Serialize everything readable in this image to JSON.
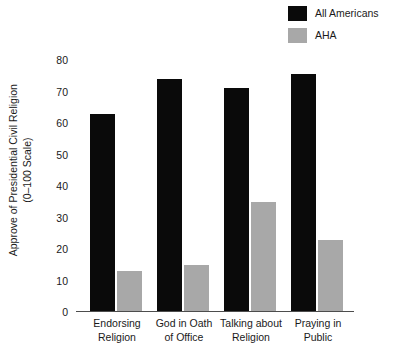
{
  "chart_data": {
    "type": "bar",
    "title": "",
    "xlabel": "",
    "ylabel": "Approve of Presidential Civil Religion",
    "ylabel_line2": "(0–100 Scale)",
    "ylim": [
      0,
      80
    ],
    "yticks": [
      0,
      10,
      20,
      30,
      40,
      50,
      60,
      70,
      80
    ],
    "grid": false,
    "legend_position": "top-right",
    "categories": [
      "Endorsing Religion",
      "God in Oath of Office",
      "Talking about Religion",
      "Praying in Public"
    ],
    "category_lines": [
      [
        "Endorsing",
        "Religion"
      ],
      [
        "God in Oath",
        "of Office"
      ],
      [
        "Talking about",
        "Religion"
      ],
      [
        "Praying in",
        "Public"
      ]
    ],
    "series": [
      {
        "name": "All Americans",
        "color": "#0a0a0a",
        "values": [
          63,
          74,
          71,
          75.5
        ]
      },
      {
        "name": "AHA",
        "color": "#a8a8a8",
        "values": [
          13,
          15,
          35,
          23
        ]
      }
    ]
  },
  "legend": {
    "items": [
      {
        "label": "All Americans",
        "color": "#0a0a0a"
      },
      {
        "label": "AHA",
        "color": "#a8a8a8"
      }
    ]
  },
  "axis": {
    "tick_labels": [
      "80",
      "70",
      "60",
      "50",
      "40",
      "30",
      "20",
      "10",
      "0"
    ]
  }
}
